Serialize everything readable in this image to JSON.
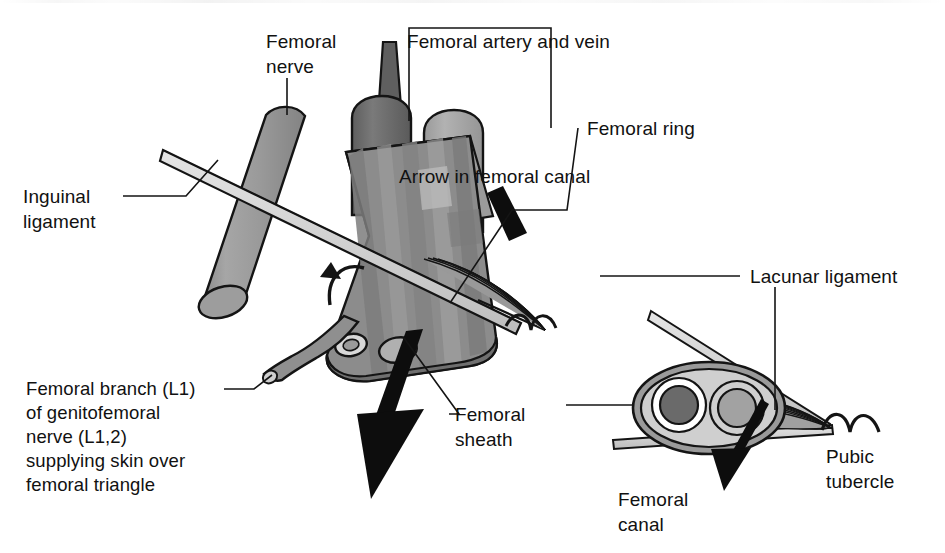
{
  "figure": {
    "background": "#ffffff"
  },
  "labels": {
    "femoral_nerve": "Femoral\nnerve",
    "femoral_artery_and_vein": "Femoral artery and vein",
    "femoral_ring": "Femoral ring",
    "arrow_in_femoral_canal": "Arrow in femoral canal",
    "inguinal_ligament": "Inguinal\nligament",
    "femoral_branch_block": "Femoral branch (L1)\nof genitofemoral\nnerve (L1,2)\nsupplying skin over\nfemoral triangle",
    "femoral_sheath": "Femoral\nsheath",
    "lacunar_ligament": "Lacunar ligament",
    "pubic_tubercle": "Pubic\ntubercle",
    "femoral_canal": "Femoral\ncanal"
  },
  "colors": {
    "outline": "#141414",
    "paper": "#ffffff",
    "artery_dark": "#6d6d6d",
    "vein_mid": "#a2a2a2",
    "nerve_gray": "#959595",
    "sheath_gray": "#8c8c8c",
    "sheath_gray_dark": "#767676",
    "sheath_gray_light": "#a8a8a8",
    "sheath_gray_lighter": "#bdbdbd",
    "ligament_light": "#d6d6d6",
    "inset_fill": "#c6c6c6",
    "inset_ring": "#8f8f8f",
    "arrow_black": "#0d0d0d"
  },
  "structures": [
    {
      "name": "femoral-nerve-cylinder",
      "shade": "#959595"
    },
    {
      "name": "femoral-artery-tube",
      "shade": "#6d6d6d"
    },
    {
      "name": "femoral-vein-tube",
      "shade": "#a2a2a2"
    },
    {
      "name": "femoral-sheath-body",
      "shade": "#8c8c8c"
    },
    {
      "name": "inguinal-ligament-band",
      "shade": "#d6d6d6"
    },
    {
      "name": "femoral-canal-funnel",
      "shade": "#b4b4b4"
    },
    {
      "name": "genitofemoral-branch-nerve",
      "shade": "#8c8c8c"
    },
    {
      "name": "inset-femoral-sheath",
      "shade": "#c6c6c6"
    },
    {
      "name": "inset-artery",
      "shade": "#6d6d6d"
    },
    {
      "name": "inset-vein",
      "shade": "#a2a2a2"
    }
  ],
  "annotations": {
    "rotation_arrow": "curved-arrow-in-sheath",
    "main_descent_arrow": "thick-black-down-arrow",
    "canal_arrow_stub": "short-black-arrow-stub",
    "inset_canal_arrow": "inset-down-arrow"
  }
}
